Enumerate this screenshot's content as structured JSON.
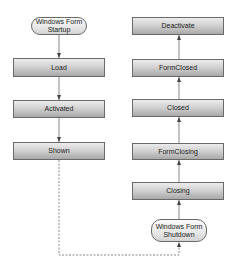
{
  "diagram": {
    "startup_node": {
      "label": "Windows Form Startup",
      "line1": "Windows Form",
      "line2": "Startup"
    },
    "shutdown_node": {
      "label": "Windows Form Shutdown",
      "line1": "Windows Form",
      "line2": "Shutdown"
    },
    "startup_sequence": [
      {
        "label": "Load"
      },
      {
        "label": "Activated"
      },
      {
        "label": "Shown"
      }
    ],
    "shutdown_sequence": [
      {
        "label": "Closing"
      },
      {
        "label": "FormClosing"
      },
      {
        "label": "Closed"
      },
      {
        "label": "FormClosed"
      },
      {
        "label": "Deactivate"
      }
    ],
    "edges": [
      {
        "from": "Windows Form Startup",
        "to": "Load",
        "style": "solid"
      },
      {
        "from": "Load",
        "to": "Activated",
        "style": "solid"
      },
      {
        "from": "Activated",
        "to": "Shown",
        "style": "solid"
      },
      {
        "from": "Shown",
        "to": "Windows Form Shutdown",
        "style": "dashed"
      },
      {
        "from": "Windows Form Shutdown",
        "to": "Closing",
        "style": "solid"
      },
      {
        "from": "Closing",
        "to": "FormClosing",
        "style": "solid"
      },
      {
        "from": "FormClosing",
        "to": "Closed",
        "style": "solid"
      },
      {
        "from": "Closed",
        "to": "FormClosed",
        "style": "solid"
      },
      {
        "from": "FormClosed",
        "to": "Deactivate",
        "style": "solid"
      }
    ],
    "colors": {
      "border": "#6a6a6a",
      "edge": "#888888",
      "arrowhead": "#444444",
      "box_top": "#ececec",
      "box_bottom": "#a9a9a9"
    }
  }
}
